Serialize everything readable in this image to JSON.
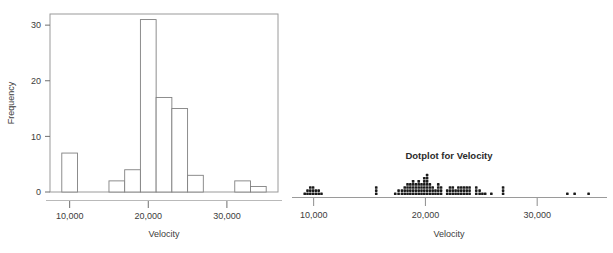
{
  "figure": {
    "background": "#ffffff",
    "ink": "#3c3c3c",
    "frame_color": "#909090"
  },
  "chart_data": [
    {
      "id": "histogram",
      "type": "bar",
      "title": "",
      "xlabel": "Velocity",
      "ylabel": "Frequency",
      "xlim": [
        7500,
        36500
      ],
      "ylim": [
        0,
        32
      ],
      "xticks": [
        10000,
        20000,
        30000
      ],
      "xtick_labels": [
        "10,000",
        "20,000",
        "30,000"
      ],
      "yticks": [
        0,
        10,
        20,
        30
      ],
      "ytick_labels": [
        "0",
        "10",
        "20",
        "30"
      ],
      "grid": false,
      "bin_width": 2000,
      "bin_edges": [
        9000,
        11000,
        13000,
        15000,
        17000,
        19000,
        21000,
        23000,
        25000,
        27000,
        29000,
        31000,
        33000,
        35000
      ],
      "categories": [
        "9000-11000",
        "11000-13000",
        "13000-15000",
        "15000-17000",
        "17000-19000",
        "19000-21000",
        "21000-23000",
        "23000-25000",
        "25000-27000",
        "27000-29000",
        "29000-31000",
        "31000-33000",
        "33000-35000"
      ],
      "values": [
        7,
        0,
        0,
        2,
        4,
        31,
        17,
        15,
        3,
        0,
        0,
        2,
        1
      ],
      "bar_fill": "#ffffff",
      "bar_edge": "#808080"
    },
    {
      "id": "dotplot",
      "type": "scatter",
      "title": "Dotplot for Velocity",
      "xlabel": "Velocity",
      "ylabel": "",
      "xlim": [
        8600,
        35800
      ],
      "xticks": [
        10000,
        20000,
        30000
      ],
      "xtick_labels": [
        "10,000",
        "20,000",
        "30,000"
      ],
      "grid": false,
      "dot_color": "#1a1a1a",
      "dot_size": 2.6,
      "stack_step": 3.1,
      "stacks": [
        {
          "x": 9200,
          "count": 1
        },
        {
          "x": 9450,
          "count": 2
        },
        {
          "x": 9700,
          "count": 3
        },
        {
          "x": 9950,
          "count": 3
        },
        {
          "x": 10200,
          "count": 2
        },
        {
          "x": 10450,
          "count": 2
        },
        {
          "x": 10700,
          "count": 1
        },
        {
          "x": 15600,
          "count": 3
        },
        {
          "x": 17300,
          "count": 1
        },
        {
          "x": 17600,
          "count": 2
        },
        {
          "x": 17900,
          "count": 2
        },
        {
          "x": 18150,
          "count": 3
        },
        {
          "x": 18400,
          "count": 4
        },
        {
          "x": 18650,
          "count": 4
        },
        {
          "x": 18900,
          "count": 5
        },
        {
          "x": 19150,
          "count": 4
        },
        {
          "x": 19400,
          "count": 5
        },
        {
          "x": 19650,
          "count": 4
        },
        {
          "x": 19900,
          "count": 6
        },
        {
          "x": 20150,
          "count": 7
        },
        {
          "x": 20400,
          "count": 4
        },
        {
          "x": 20650,
          "count": 3
        },
        {
          "x": 20900,
          "count": 2
        },
        {
          "x": 21150,
          "count": 4
        },
        {
          "x": 21400,
          "count": 3
        },
        {
          "x": 21950,
          "count": 2
        },
        {
          "x": 22200,
          "count": 3
        },
        {
          "x": 22450,
          "count": 3
        },
        {
          "x": 22700,
          "count": 2
        },
        {
          "x": 22950,
          "count": 3
        },
        {
          "x": 23200,
          "count": 3
        },
        {
          "x": 23450,
          "count": 3
        },
        {
          "x": 23700,
          "count": 3
        },
        {
          "x": 23950,
          "count": 3
        },
        {
          "x": 24550,
          "count": 3
        },
        {
          "x": 24850,
          "count": 2
        },
        {
          "x": 25100,
          "count": 1
        },
        {
          "x": 25350,
          "count": 1
        },
        {
          "x": 25900,
          "count": 1
        },
        {
          "x": 26950,
          "count": 3
        },
        {
          "x": 32700,
          "count": 1
        },
        {
          "x": 33350,
          "count": 1
        },
        {
          "x": 34600,
          "count": 1
        }
      ],
      "axis_color": "#999999"
    }
  ]
}
